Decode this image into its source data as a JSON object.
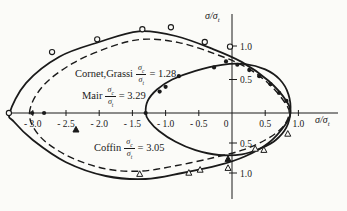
{
  "figure": {
    "background": "#fbfbf8",
    "ink_color": "#1a1a1a"
  },
  "axes": {
    "x_label_main": "σ/σ",
    "x_label_sub": "t",
    "y_label_main": "σ/σ",
    "y_label_sub": "t"
  },
  "annotations": [
    {
      "name": "Cornet,Grassi",
      "num": "σ",
      "num_sub": "c",
      "den": "σ",
      "den_sub": "t",
      "value": "= 1.28"
    },
    {
      "name": "Mair",
      "num": "σ",
      "num_sub": "c",
      "den": "σ",
      "den_sub": "t",
      "value": "= 3.29"
    },
    {
      "name": "Coffin",
      "num": "σ",
      "num_sub": "c",
      "den": "σ",
      "den_sub": "t",
      "value": "= 3.05"
    }
  ],
  "chart_data": {
    "type": "line",
    "title": "",
    "xlabel": "σ/σt",
    "ylabel": "σ/σt",
    "xlim": [
      -3.6,
      1.45
    ],
    "ylim": [
      -1.5,
      1.5
    ],
    "grid": false,
    "legend_position": "none",
    "x_ticks": [
      {
        "v": -3.0,
        "label": "- 3.0"
      },
      {
        "v": -2.5,
        "label": "- 2.5"
      },
      {
        "v": -2.0,
        "label": "- 2.0"
      },
      {
        "v": -1.5,
        "label": "- 1.5"
      },
      {
        "v": -1.0,
        "label": "- 1.0"
      },
      {
        "v": -0.5,
        "label": "- 0.5"
      },
      {
        "v": 0.0,
        "label": "0"
      },
      {
        "v": 0.5,
        "label": "0.5"
      },
      {
        "v": 1.0,
        "label": "1.0"
      }
    ],
    "y_ticks": [
      {
        "v": 1.0,
        "label": "1.0"
      },
      {
        "v": 0.5,
        "label": "0.5"
      },
      {
        "v": -0.5,
        "label": "0.5"
      },
      {
        "v": -1.0,
        "label": "1.0"
      }
    ],
    "series": [
      {
        "name": "Mair envelope",
        "ratio": 3.29,
        "style": "solid",
        "closed": true,
        "points": [
          [
            -3.35,
            0.0
          ],
          [
            -3.1,
            0.45
          ],
          [
            -2.6,
            0.84
          ],
          [
            -2.0,
            1.06
          ],
          [
            -1.4,
            1.22
          ],
          [
            -0.85,
            1.15
          ],
          [
            -0.3,
            0.96
          ],
          [
            0.15,
            0.76
          ],
          [
            0.55,
            0.48
          ],
          [
            0.82,
            0.18
          ],
          [
            0.88,
            0.0
          ],
          [
            0.8,
            -0.2
          ],
          [
            0.55,
            -0.5
          ],
          [
            0.2,
            -0.72
          ],
          [
            -0.2,
            -0.87
          ],
          [
            -0.75,
            -1.0
          ],
          [
            -1.3,
            -1.1
          ],
          [
            -1.9,
            -1.05
          ],
          [
            -2.5,
            -0.82
          ],
          [
            -3.0,
            -0.45
          ],
          [
            -3.28,
            -0.15
          ]
        ]
      },
      {
        "name": "Coffin envelope",
        "ratio": 3.05,
        "style": "dashed",
        "closed": true,
        "points": [
          [
            -3.05,
            0.0
          ],
          [
            -2.85,
            0.4
          ],
          [
            -2.4,
            0.74
          ],
          [
            -1.85,
            0.98
          ],
          [
            -1.35,
            1.1
          ],
          [
            -0.8,
            1.05
          ],
          [
            -0.25,
            0.88
          ],
          [
            0.2,
            0.69
          ],
          [
            0.55,
            0.44
          ],
          [
            0.8,
            0.15
          ],
          [
            0.86,
            -0.02
          ],
          [
            0.75,
            -0.25
          ],
          [
            0.5,
            -0.45
          ],
          [
            0.15,
            -0.62
          ],
          [
            -0.3,
            -0.75
          ],
          [
            -0.85,
            -0.88
          ],
          [
            -1.4,
            -0.97
          ],
          [
            -1.95,
            -0.92
          ],
          [
            -2.5,
            -0.7
          ],
          [
            -2.9,
            -0.38
          ]
        ]
      },
      {
        "name": "Cornet-Grassi envelope",
        "ratio": 1.28,
        "style": "solid",
        "closed": true,
        "points": [
          [
            -1.3,
            0.0
          ],
          [
            -1.27,
            0.18
          ],
          [
            -1.13,
            0.35
          ],
          [
            -0.9,
            0.5
          ],
          [
            -0.55,
            0.63
          ],
          [
            -0.15,
            0.72
          ],
          [
            0.2,
            0.73
          ],
          [
            0.5,
            0.65
          ],
          [
            0.72,
            0.5
          ],
          [
            0.85,
            0.28
          ],
          [
            0.88,
            0.02
          ],
          [
            0.82,
            -0.24
          ],
          [
            0.66,
            -0.45
          ],
          [
            0.45,
            -0.58
          ],
          [
            0.15,
            -0.69
          ],
          [
            -0.2,
            -0.7
          ],
          [
            -0.55,
            -0.62
          ],
          [
            -0.85,
            -0.48
          ],
          [
            -1.1,
            -0.3
          ],
          [
            -1.25,
            -0.13
          ]
        ]
      }
    ],
    "scatter": [
      {
        "name": "open-circle-data",
        "marker": "circle-open",
        "points": [
          [
            -3.36,
            0.0
          ],
          [
            -2.71,
            0.91
          ],
          [
            -2.03,
            1.1
          ],
          [
            -1.35,
            1.25
          ],
          [
            -0.92,
            1.28
          ],
          [
            -0.41,
            1.06
          ],
          [
            -0.03,
            0.99
          ]
        ]
      },
      {
        "name": "filled-dot-data",
        "marker": "circle-filled",
        "points": [
          [
            -3.01,
            0.0
          ],
          [
            -2.83,
            0.0
          ],
          [
            -1.3,
            0.0
          ],
          [
            -1.09,
            0.32
          ],
          [
            -1.0,
            0.39
          ],
          [
            -0.8,
            0.55
          ],
          [
            -0.27,
            0.68
          ],
          [
            -0.09,
            0.77
          ],
          [
            0.08,
            0.72
          ],
          [
            0.26,
            0.64
          ],
          [
            0.41,
            0.55
          ],
          [
            0.58,
            0.43
          ],
          [
            0.71,
            0.3
          ],
          [
            0.82,
            0.18
          ]
        ]
      },
      {
        "name": "open-triangle-data",
        "marker": "triangle-open",
        "points": [
          [
            -1.39,
            -1.02
          ],
          [
            -0.65,
            -1.0
          ],
          [
            -0.48,
            -0.95
          ],
          [
            -0.06,
            -0.92
          ],
          [
            0.35,
            -0.6
          ],
          [
            0.48,
            -0.62
          ],
          [
            0.84,
            -0.35
          ]
        ]
      },
      {
        "name": "filled-triangle-data",
        "marker": "triangle-filled",
        "points": [
          [
            -2.35,
            -0.28
          ],
          [
            -0.06,
            -0.77
          ]
        ]
      }
    ]
  }
}
